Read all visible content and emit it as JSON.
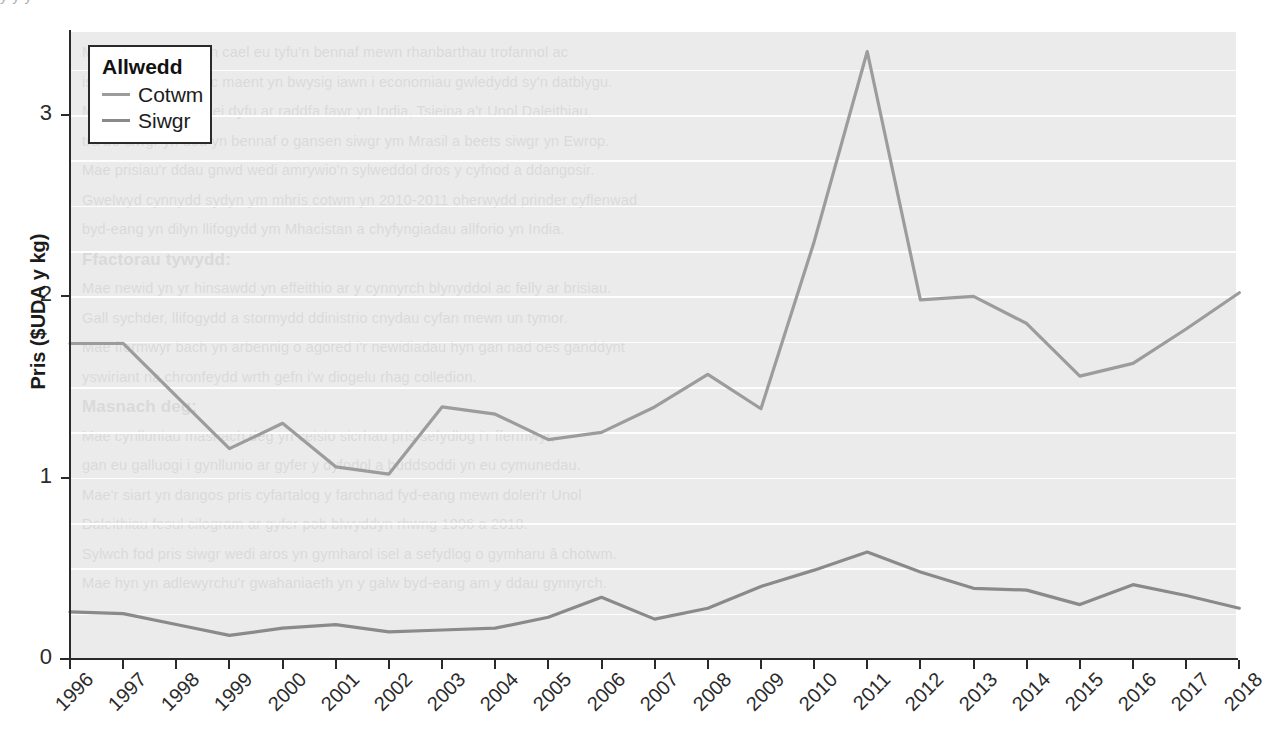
{
  "legend": {
    "title": "Allwedd",
    "entries": [
      {
        "label": "Cotwm",
        "color": "#9c9c9c"
      },
      {
        "label": "Siwgr",
        "color": "#8a8a8a"
      }
    ]
  },
  "axes": {
    "y_label": "Pris ($UDA y kg)",
    "y_ticks": [
      "0",
      "1",
      "2",
      "3"
    ],
    "x_ticks": [
      "1996",
      "1997",
      "1998",
      "1999",
      "2000",
      "2001",
      "2002",
      "2003",
      "2004",
      "2005",
      "2006",
      "2007",
      "2008",
      "2009",
      "2010",
      "2011",
      "2012",
      "2013",
      "2014",
      "2015",
      "2016",
      "2017",
      "2018"
    ]
  },
  "style": {
    "plot_background": "#ebebeb",
    "gridline_color": "#fdfdfd",
    "axis_color": "#2a2a2a",
    "page_background": "#ffffff"
  },
  "background_text": {
    "top_bleed": "y                                               y                  y",
    "lines": [
      "Mae'r cnydau hyn yn cael eu tyfu'n bennaf mewn rhanbarthau trofannol ac",
      "isdrofannol y byd, ac maent yn bwysig iawn i economiau gwledydd sy'n datblygu.",
      "Mae cotwm yn cael ei dyfu ar raddfa fawr yn India, Tsieina a'r Unol Daleithiau,",
      "tra bo siwgr yn dod yn bennaf o gansen siwgr ym Mrasil a beets siwgr yn Ewrop.",
      "Mae prisiau'r ddau gnwd wedi amrywio'n sylweddol dros y cyfnod a ddangosir.",
      "Gwelwyd cynnydd sydyn ym mhris cotwm yn 2010-2011 oherwydd prinder cyflenwad",
      "byd-eang yn dilyn llifogydd ym Mhacistan a chyfyngiadau allforio yn India.",
      "Ffactorau tywydd:",
      "Mae newid yn yr hinsawdd yn effeithio ar y cynnyrch blynyddol ac felly ar brisiau.",
      "Gall sychder, llifogydd a stormydd ddinistrio cnydau cyfan mewn un tymor.",
      "Mae ffermwyr bach yn arbennig o agored i'r newidiadau hyn gan nad oes ganddynt",
      "yswiriant na chronfeydd wrth gefn i'w diogelu rhag colledion.",
      "Masnach deg:",
      "Mae cynlluniau masnach deg yn ceisio sicrhau pris sefydlog i'r ffermwyr,",
      "gan eu galluogi i gynllunio ar gyfer y dyfodol a buddsoddi yn eu cymunedau.",
      "Mae'r siart yn dangos pris cyfartalog y farchnad fyd-eang mewn doleri'r Unol",
      "Daleithiau fesul cilogram ar gyfer pob blwyddyn rhwng 1996 a 2018.",
      "Sylwch fod pris siwgr wedi aros yn gymharol isel a sefydlog o gymharu â chotwm.",
      "Mae hyn yn adlewyrchu'r gwahaniaeth yn y galw byd-eang am y ddau gynnyrch."
    ]
  },
  "chart_data": {
    "type": "line",
    "title": "",
    "xlabel": "",
    "ylabel": "Pris ($UDA y kg)",
    "x": [
      1996,
      1997,
      1998,
      1999,
      2000,
      2001,
      2002,
      2003,
      2004,
      2005,
      2006,
      2007,
      2008,
      2009,
      2010,
      2011,
      2012,
      2013,
      2014,
      2015,
      2016,
      2017,
      2018
    ],
    "ylim": [
      0,
      3.46
    ],
    "xlim": [
      1996,
      2018
    ],
    "grid": true,
    "grid_interval": 0.25,
    "legend_position": "top-left",
    "series": [
      {
        "name": "Cotwm",
        "color": "#9c9c9c",
        "values": [
          1.74,
          1.74,
          1.45,
          1.16,
          1.3,
          1.06,
          1.02,
          1.39,
          1.35,
          1.21,
          1.25,
          1.39,
          1.57,
          1.38,
          2.3,
          3.35,
          1.98,
          2.0,
          1.85,
          1.56,
          1.63,
          1.82,
          2.02
        ]
      },
      {
        "name": "Siwgr",
        "color": "#8a8a8a",
        "values": [
          0.26,
          0.25,
          0.19,
          0.13,
          0.17,
          0.19,
          0.15,
          0.16,
          0.17,
          0.23,
          0.34,
          0.22,
          0.28,
          0.4,
          0.49,
          0.59,
          0.48,
          0.39,
          0.38,
          0.3,
          0.41,
          0.35,
          0.28
        ]
      }
    ]
  }
}
